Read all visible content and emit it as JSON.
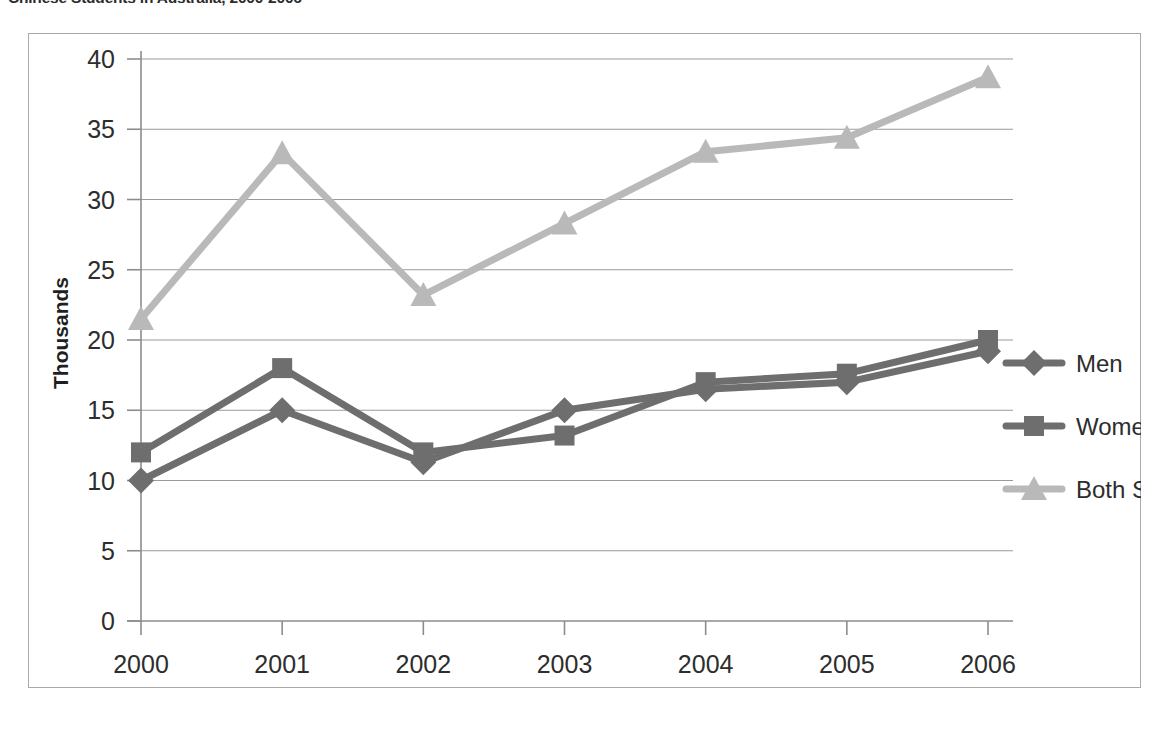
{
  "title": "Chinese Students in Australia, 2000-2006",
  "axis": {
    "ylabel": "Thousands",
    "xlabel": "",
    "yticks": [
      "0",
      "5",
      "10",
      "15",
      "20",
      "25",
      "30",
      "35",
      "40"
    ],
    "xticks": [
      "2000",
      "2001",
      "2002",
      "2003",
      "2004",
      "2005",
      "2006"
    ]
  },
  "legend": {
    "items": [
      {
        "label": "Men",
        "marker": "diamond-marker",
        "color": "#6e6e6e"
      },
      {
        "label": "Women",
        "marker": "square-marker",
        "color": "#6e6e6e"
      },
      {
        "label": "Both Sexes",
        "marker": "triangle-marker",
        "color": "#b9b9b9"
      }
    ]
  },
  "chart_data": {
    "type": "line",
    "title": "Chinese Students in Australia, 2000-2006",
    "xlabel": "",
    "ylabel": "Thousands",
    "categories": [
      "2000",
      "2001",
      "2002",
      "2003",
      "2004",
      "2005",
      "2006"
    ],
    "series": [
      {
        "name": "Men",
        "marker": "diamond",
        "color": "#6e6e6e",
        "values": [
          10.0,
          15.0,
          11.3,
          15.0,
          16.5,
          17.0,
          19.2
        ]
      },
      {
        "name": "Women",
        "marker": "square",
        "color": "#6e6e6e",
        "values": [
          12.0,
          18.0,
          12.0,
          13.2,
          17.0,
          17.6,
          20.0
        ]
      },
      {
        "name": "Both Sexes",
        "marker": "triangle",
        "color": "#b9b9b9",
        "values": [
          21.5,
          33.3,
          23.2,
          28.3,
          33.4,
          34.4,
          38.7
        ]
      }
    ],
    "ylim": [
      0,
      40
    ],
    "ytick_step": 5,
    "grid": true,
    "legend_position": "right"
  }
}
